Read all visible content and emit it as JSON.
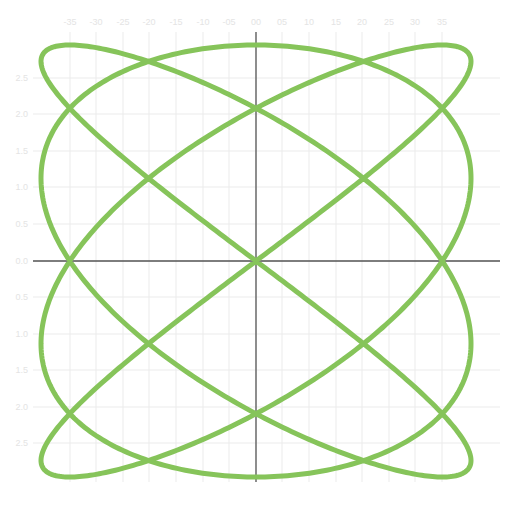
{
  "chart_data": {
    "type": "line",
    "title": "",
    "xlabel": "",
    "ylabel": "",
    "parametric": {
      "x": "sin(4t + pi/3)",
      "y": "sin(3t)",
      "t_range": [
        0,
        6.2832
      ]
    },
    "xlim": [
      -4.2,
      4.2
    ],
    "ylim": [
      -3.6,
      3.6
    ],
    "x_tick_labels": [
      "-35",
      "-30",
      "-25",
      "-20",
      "-15",
      "-10",
      "-05",
      "00",
      "05",
      "10",
      "15",
      "20",
      "25",
      "30",
      "35"
    ],
    "y_tick_labels": [
      "2.5",
      "2.0",
      "1.5",
      "1.0",
      "0.5",
      "0.0",
      "0.5",
      "1.0",
      "1.5",
      "2.0",
      "2.5"
    ],
    "grid": true,
    "legend": null,
    "series": [
      {
        "name": "lissajous",
        "color": "#86c45a"
      }
    ]
  },
  "colors": {
    "curve": "#86c45a",
    "axis": "#555555",
    "grid": "#ebebeb",
    "tick_label": "#e2e2e2"
  },
  "layout": {
    "origin_px": [
      256,
      261
    ],
    "x_amp_px": 215,
    "y_amp_px": 216,
    "x_grid_px": [
      70,
      96,
      123,
      149,
      176,
      203,
      229,
      256,
      282,
      309,
      336,
      362,
      389,
      415,
      442
    ],
    "y_grid_px": [
      78,
      114,
      151,
      187,
      224,
      261,
      297,
      334,
      370,
      407,
      443
    ]
  }
}
